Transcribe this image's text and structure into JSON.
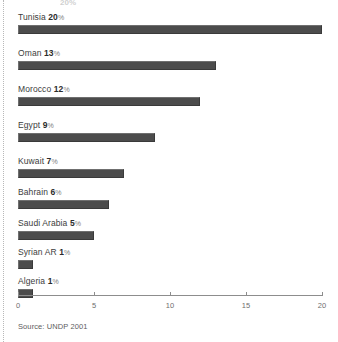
{
  "figure": {
    "background_color": "#ffffff",
    "bar_color": "#4c4c4c",
    "axis_color": "#8d8d8d",
    "source_note": "Source: UNDP 2001",
    "top_clipped_fragment": "20%"
  },
  "chart_data": {
    "type": "bar",
    "orientation": "horizontal",
    "title": "",
    "subtitle": "",
    "xlabel": "",
    "ylabel": "",
    "xlim": [
      0,
      20
    ],
    "xticks": [
      0,
      5,
      10,
      15,
      20
    ],
    "xticklabels": [
      "0",
      "5",
      "10",
      "15",
      "20"
    ],
    "grid": false,
    "legend": false,
    "units": "percent",
    "categories": [
      "Tunisia",
      "Oman",
      "Morocco",
      "Egypt",
      "Kuwait",
      "Bahrain",
      "Saudi Arabia",
      "Syrian AR",
      "Algeria"
    ],
    "values": [
      20,
      13,
      12,
      9,
      7,
      6,
      5,
      1,
      1
    ],
    "value_labels": [
      "20%",
      "13%",
      "12%",
      "9%",
      "7%",
      "6%",
      "5%",
      "1%",
      "1%"
    ],
    "rows": [
      {
        "name": "Tunisia",
        "value": 20,
        "value_text": "20",
        "pct_symbol": "%",
        "top": 0,
        "bar_top": 13
      },
      {
        "name": "Oman",
        "value": 13,
        "value_text": "13",
        "pct_symbol": "%",
        "top": 36,
        "bar_top": 49
      },
      {
        "name": "Morocco",
        "value": 12,
        "value_text": "12",
        "pct_symbol": "%",
        "top": 72,
        "bar_top": 85
      },
      {
        "name": "Egypt",
        "value": 9,
        "value_text": "9",
        "pct_symbol": "%",
        "top": 108,
        "bar_top": 121
      },
      {
        "name": "Kuwait",
        "value": 7,
        "value_text": "7",
        "pct_symbol": "%",
        "top": 144,
        "bar_top": 157
      },
      {
        "name": "Bahrain",
        "value": 6,
        "value_text": "6",
        "pct_symbol": "%",
        "top": 175,
        "bar_top": 188
      },
      {
        "name": "Saudi Arabia",
        "value": 5,
        "value_text": "5",
        "pct_symbol": "%",
        "top": 206,
        "bar_top": 219
      },
      {
        "name": "Syrian AR",
        "value": 1,
        "value_text": "1",
        "pct_symbol": "%",
        "top": 235,
        "bar_top": 248
      },
      {
        "name": "Algeria",
        "value": 1,
        "value_text": "1",
        "pct_symbol": "%",
        "top": 264,
        "bar_top": 277
      }
    ]
  }
}
